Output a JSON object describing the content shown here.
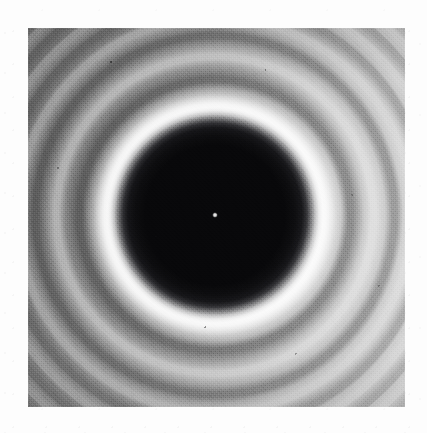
{
  "figure": {
    "kind": "photograph",
    "caption": "",
    "medium": "monochrome halftone photographic print",
    "plate": {
      "left_px": 28,
      "top_px": 28,
      "width_px": 377,
      "height_px": 379
    },
    "canvas": {
      "width_px": 427,
      "height_px": 433,
      "margin_color": "#fdfdfd"
    }
  },
  "chart_data": {
    "type": "heatmap",
    "subtitle": "Axial bright Poisson spot with concentric exterior fringes",
    "xlabel": "",
    "ylabel": "",
    "grid": false,
    "legend": "none",
    "colormap": "grayscale",
    "value_label": "relative irradiance (0 = black, 1 = white)",
    "geometry": {
      "center_x_px": 215,
      "center_y_px": 215,
      "disc_shadow_radius_px": 95,
      "axial_bright_spot_radius_px": 2
    },
    "radial_profile": {
      "r_px": [
        0,
        2,
        8,
        25,
        50,
        70,
        84,
        90,
        95,
        101,
        106,
        113,
        122,
        130,
        136,
        146,
        153,
        159,
        168,
        174,
        179,
        187,
        192,
        197,
        204,
        209,
        213,
        219,
        224,
        228,
        234,
        238,
        242,
        247,
        251,
        255,
        260,
        264,
        267,
        272,
        276,
        279
      ],
      "intensity": [
        0.92,
        0.88,
        0.06,
        0.03,
        0.03,
        0.03,
        0.05,
        0.14,
        0.42,
        0.86,
        0.94,
        0.72,
        0.48,
        0.3,
        0.29,
        0.5,
        0.7,
        0.68,
        0.52,
        0.38,
        0.37,
        0.52,
        0.64,
        0.63,
        0.52,
        0.42,
        0.41,
        0.52,
        0.61,
        0.6,
        0.52,
        0.44,
        0.43,
        0.52,
        0.59,
        0.58,
        0.52,
        0.46,
        0.45,
        0.52,
        0.57,
        0.57
      ]
    },
    "rings": [
      {
        "order": 0,
        "kind": "axial-bright-spot",
        "radius_px": 2,
        "relative_intensity": 0.92
      },
      {
        "order": 0,
        "kind": "geometric-shadow",
        "radius_px": 95,
        "relative_intensity": 0.03
      },
      {
        "order": 1,
        "kind": "bright",
        "radius_px": 106,
        "relative_intensity": 0.94
      },
      {
        "order": 1,
        "kind": "dark",
        "radius_px": 133,
        "relative_intensity": 0.29
      },
      {
        "order": 2,
        "kind": "bright",
        "radius_px": 156,
        "relative_intensity": 0.7
      },
      {
        "order": 2,
        "kind": "dark",
        "radius_px": 177,
        "relative_intensity": 0.37
      },
      {
        "order": 3,
        "kind": "bright",
        "radius_px": 195,
        "relative_intensity": 0.64
      },
      {
        "order": 3,
        "kind": "dark",
        "radius_px": 211,
        "relative_intensity": 0.41
      },
      {
        "order": 4,
        "kind": "bright",
        "radius_px": 226,
        "relative_intensity": 0.61
      },
      {
        "order": 4,
        "kind": "dark",
        "radius_px": 240,
        "relative_intensity": 0.43
      },
      {
        "order": 5,
        "kind": "bright",
        "radius_px": 253,
        "relative_intensity": 0.59
      },
      {
        "order": 5,
        "kind": "dark",
        "radius_px": 266,
        "relative_intensity": 0.45
      },
      {
        "order": 6,
        "kind": "bright",
        "radius_px": 278,
        "relative_intensity": 0.57
      }
    ],
    "illumination_gradient": {
      "description": "overall print density falls from left to right",
      "left_edge_gray": "#6f6f6f",
      "right_edge_gray": "#d4d4d4",
      "angle_deg": 100
    },
    "palette": {
      "umbra_black": "#070709",
      "halo_white": "#f2f2f2",
      "field_mid_gray": "#a8a8a8",
      "margin_white": "#fdfdfd"
    }
  }
}
